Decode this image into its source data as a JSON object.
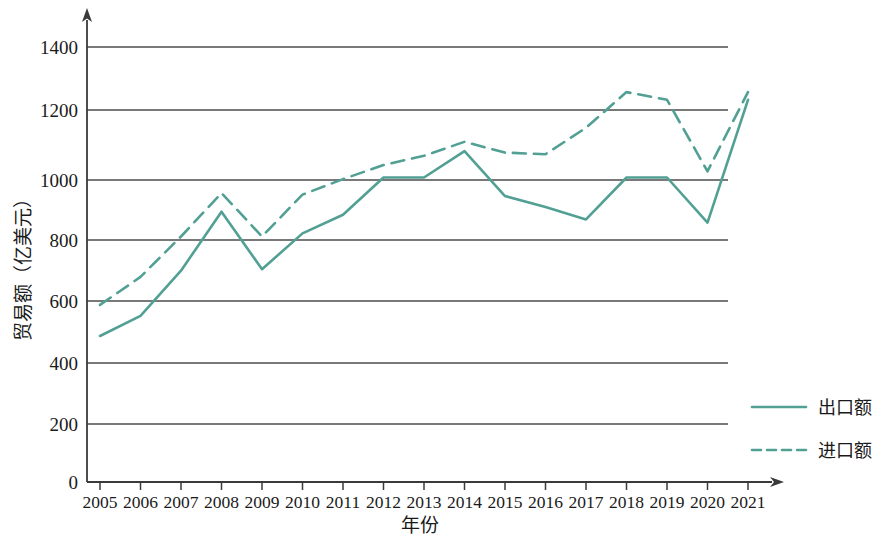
{
  "chart_data": {
    "type": "line",
    "title": "",
    "xlabel": "年份",
    "ylabel": "贸易额（亿美元）",
    "grid": true,
    "legend_position": "right-bottom",
    "xlim": [
      2005,
      2021
    ],
    "ylim": [
      0,
      1400
    ],
    "yticks": [
      0,
      200,
      400,
      600,
      800,
      1000,
      1200,
      1400
    ],
    "ytick_labels": [
      "0",
      "200",
      "400",
      "600",
      "800",
      "1000",
      "1200",
      "1400"
    ],
    "categories": [
      2005,
      2006,
      2007,
      2008,
      2009,
      2010,
      2011,
      2012,
      2013,
      2014,
      2015,
      2016,
      2017,
      2018,
      2019,
      2020,
      2021
    ],
    "xtick_labels": [
      "2005",
      "2006",
      "2007",
      "2008",
      "2009",
      "2010",
      "2011",
      "2012",
      "2013",
      "2014",
      "2015",
      "2016",
      "2017",
      "2018",
      "2019",
      "2020",
      "2021"
    ],
    "series": [
      {
        "name": "出口额",
        "style": "solid",
        "color": "#52a094",
        "values": [
          470,
          535,
          680,
          870,
          685,
          800,
          860,
          980,
          980,
          1065,
          920,
          885,
          845,
          980,
          980,
          835,
          1230
        ]
      },
      {
        "name": "进口额",
        "style": "dashed",
        "color": "#52a094",
        "values": [
          570,
          660,
          790,
          930,
          790,
          925,
          975,
          1020,
          1050,
          1095,
          1060,
          1055,
          1140,
          1255,
          1230,
          1000,
          1255
        ]
      }
    ]
  },
  "legend": {
    "items": [
      {
        "label": "出口额",
        "style": "solid"
      },
      {
        "label": "进口额",
        "style": "dashed"
      }
    ]
  },
  "axes": {
    "y_title": "贸易额（亿美元）",
    "x_title": "年份"
  },
  "colors": {
    "series": "#52a094",
    "axis": "#3a3a3a",
    "grid": "#4d4d4d",
    "text": "#1a1a1a",
    "background": "#ffffff"
  }
}
